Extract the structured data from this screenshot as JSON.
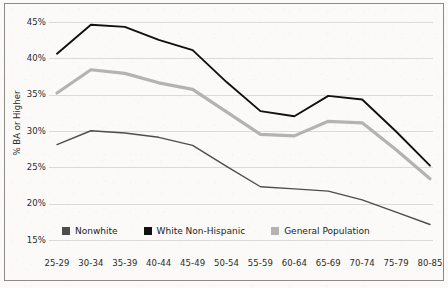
{
  "chart_data": {
    "type": "line",
    "title": "",
    "subtitle": "",
    "xlabel": "",
    "ylabel": "% BA or Higher",
    "categories": [
      "25-29",
      "30-34",
      "35-39",
      "40-44",
      "45-49",
      "50-54",
      "55-59",
      "60-64",
      "65-69",
      "70-74",
      "75-79",
      "80-85"
    ],
    "ylim": [
      15,
      45
    ],
    "ytick_labels": [
      "45%",
      "40%",
      "35%",
      "30%",
      "25%",
      "20%",
      "15%"
    ],
    "ytick_values": [
      45,
      40,
      35,
      30,
      25,
      20,
      15
    ],
    "grid": true,
    "grid_axis": "y",
    "legend_position": "inside-bottom-left",
    "series": [
      {
        "name": "Nonwhite",
        "color": "#4d4d4d",
        "values": [
          28.2,
          30.1,
          29.8,
          29.2,
          28.1,
          25.2,
          22.4,
          22.1,
          21.8,
          20.6,
          18.9,
          17.2
        ]
      },
      {
        "name": "White Non-Hispanic",
        "color": "#111111",
        "values": [
          40.7,
          44.7,
          44.4,
          42.6,
          41.2,
          36.8,
          32.8,
          32.1,
          34.9,
          34.4,
          30.0,
          25.3
        ]
      },
      {
        "name": "General Population",
        "color": "#b3b3b3",
        "values": [
          35.3,
          38.5,
          38.0,
          36.7,
          35.8,
          32.7,
          29.6,
          29.4,
          31.4,
          31.2,
          27.5,
          23.5
        ]
      }
    ]
  },
  "legend": {
    "entries": [
      {
        "label": "Nonwhite",
        "color": "#4d4d4d"
      },
      {
        "label": "White Non-Hispanic",
        "color": "#111111"
      },
      {
        "label": "General Population",
        "color": "#b3b3b3"
      }
    ]
  },
  "axes": {
    "y_title": "% BA or Higher"
  },
  "style": {
    "frame_color": "#8d8a85",
    "grid_color": "#dcdad6",
    "background": "#fbfaf8",
    "text_color": "#2b2b2b"
  }
}
